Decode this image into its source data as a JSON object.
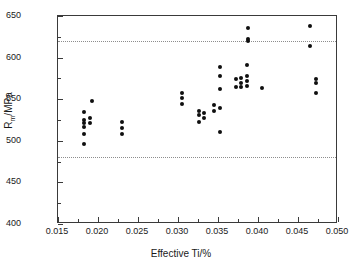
{
  "chart_data": {
    "type": "scatter",
    "title": "",
    "xlabel": "Effective Ti/%",
    "ylabel": "R",
    "ylabel_sub": "m",
    "ylabel_unit": "/MPa",
    "ylabel_full": "Rm/MPa",
    "xlim": [
      0.015,
      0.05
    ],
    "ylim": [
      400,
      650
    ],
    "xticks": [
      0.015,
      0.02,
      0.025,
      0.03,
      0.035,
      0.04,
      0.045,
      0.05
    ],
    "xtick_labels": [
      "0.015",
      "0.020",
      "0.025",
      "0.030",
      "0.035",
      "0.040",
      "0.045",
      "0.050"
    ],
    "yticks": [
      400,
      450,
      500,
      550,
      600,
      650
    ],
    "ytick_labels": [
      "400",
      "450",
      "500",
      "550",
      "600",
      "650"
    ],
    "x_minor_ticks": [
      0.0175,
      0.0225,
      0.0275,
      0.0325,
      0.0375,
      0.0425,
      0.0475
    ],
    "y_minor_ticks": [
      425,
      475,
      525,
      575,
      625
    ],
    "grid": false,
    "legend": null,
    "marker": "filled-circle",
    "marker_color": "#0f0f0f",
    "reference_lines": [
      {
        "name": "upper-spec-limit",
        "y": 620,
        "style": "dotted",
        "color": "#8d8d8d"
      },
      {
        "name": "lower-spec-limit",
        "y": 480,
        "style": "dotted",
        "color": "#8d8d8d"
      }
    ],
    "points": [
      {
        "x": 0.0182,
        "y": 535
      },
      {
        "x": 0.0182,
        "y": 525
      },
      {
        "x": 0.0182,
        "y": 521
      },
      {
        "x": 0.0182,
        "y": 517
      },
      {
        "x": 0.0182,
        "y": 508
      },
      {
        "x": 0.0182,
        "y": 496
      },
      {
        "x": 0.0192,
        "y": 548
      },
      {
        "x": 0.019,
        "y": 528
      },
      {
        "x": 0.019,
        "y": 521
      },
      {
        "x": 0.023,
        "y": 522
      },
      {
        "x": 0.023,
        "y": 515
      },
      {
        "x": 0.023,
        "y": 508
      },
      {
        "x": 0.0305,
        "y": 557
      },
      {
        "x": 0.0305,
        "y": 552
      },
      {
        "x": 0.0305,
        "y": 544
      },
      {
        "x": 0.0326,
        "y": 536
      },
      {
        "x": 0.0326,
        "y": 531
      },
      {
        "x": 0.0326,
        "y": 523
      },
      {
        "x": 0.0333,
        "y": 534
      },
      {
        "x": 0.0333,
        "y": 528
      },
      {
        "x": 0.0352,
        "y": 589
      },
      {
        "x": 0.0352,
        "y": 578
      },
      {
        "x": 0.0352,
        "y": 562
      },
      {
        "x": 0.0352,
        "y": 540
      },
      {
        "x": 0.0345,
        "y": 543
      },
      {
        "x": 0.0345,
        "y": 536
      },
      {
        "x": 0.0352,
        "y": 511
      },
      {
        "x": 0.0388,
        "y": 636
      },
      {
        "x": 0.0388,
        "y": 622
      },
      {
        "x": 0.0388,
        "y": 620
      },
      {
        "x": 0.0386,
        "y": 591
      },
      {
        "x": 0.0386,
        "y": 578
      },
      {
        "x": 0.0386,
        "y": 572
      },
      {
        "x": 0.0386,
        "y": 566
      },
      {
        "x": 0.0379,
        "y": 576
      },
      {
        "x": 0.0379,
        "y": 569
      },
      {
        "x": 0.0379,
        "y": 565
      },
      {
        "x": 0.0372,
        "y": 574
      },
      {
        "x": 0.0372,
        "y": 565
      },
      {
        "x": 0.0405,
        "y": 563
      },
      {
        "x": 0.0465,
        "y": 638
      },
      {
        "x": 0.0465,
        "y": 614
      },
      {
        "x": 0.0472,
        "y": 574
      },
      {
        "x": 0.0472,
        "y": 569
      },
      {
        "x": 0.0472,
        "y": 557
      }
    ]
  }
}
